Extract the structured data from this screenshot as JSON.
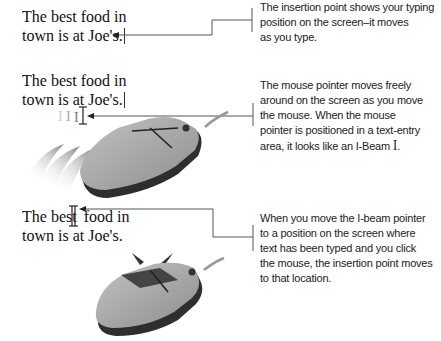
{
  "panels": [
    {
      "sample_text": [
        "The best food in",
        "town is at Joe's."
      ],
      "caption": [
        "The insertion point shows your typing",
        "position on the screen–it moves",
        "as you type."
      ],
      "icon": "insertion-point-caret"
    },
    {
      "sample_text": [
        "The best food in",
        "town is at Joe's."
      ],
      "caption": [
        "The mouse pointer moves freely",
        "around on the screen as you move",
        "the mouse. When the mouse",
        "pointer is positioned in a text-entry",
        "area, it looks like an I-Beam"
      ],
      "caption_end": ".",
      "icon": "mouse-moving"
    },
    {
      "sample_text_a": "The best",
      "sample_text_b": "food in",
      "sample_text_2": "town is at Joe's.",
      "caption": [
        "When you move the I-beam pointer",
        "to a position on the screen where",
        "text has been typed and you click",
        "the mouse, the insertion point moves",
        "to that location."
      ],
      "icon": "mouse-clicking"
    }
  ],
  "colors": {
    "text": "#111111",
    "line": "#555555",
    "mouse_body": "#a9a9a9",
    "mouse_dark": "#3a3a3a"
  }
}
